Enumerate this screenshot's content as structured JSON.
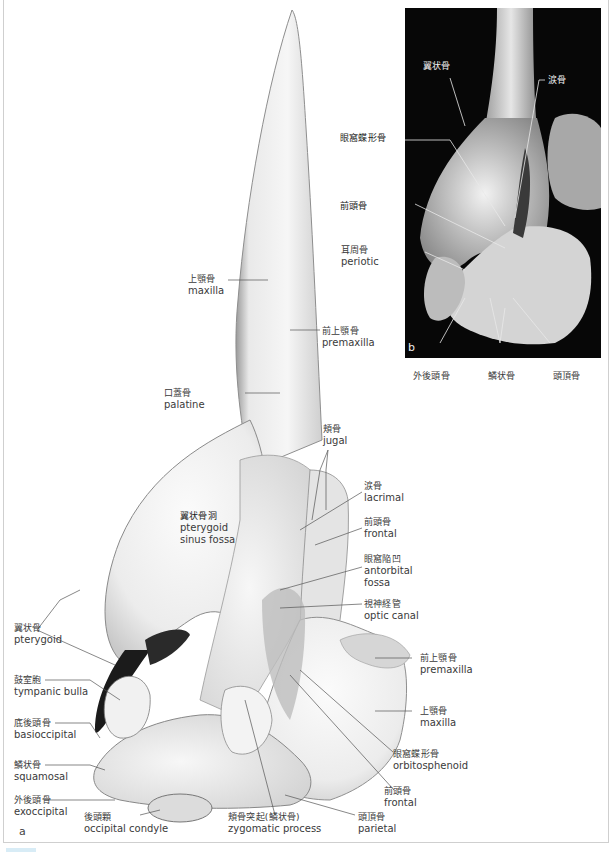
{
  "figure": {
    "panel_a": {
      "letter": "a",
      "labels": [
        {
          "id": "maxilla-upper",
          "jp": "上顎骨",
          "en": "maxilla"
        },
        {
          "id": "premaxilla-upper",
          "jp": "前上顎骨",
          "en": "premaxilla"
        },
        {
          "id": "palatine",
          "jp": "口蓋骨",
          "en": "palatine"
        },
        {
          "id": "jugal",
          "jp": "頬骨",
          "en": "jugal"
        },
        {
          "id": "lacrimal",
          "jp": "涙骨",
          "en": "lacrimal"
        },
        {
          "id": "frontal-upper",
          "jp": "前頭骨",
          "en": "frontal"
        },
        {
          "id": "pterygoid-sinus-fossa",
          "jp": "翼状骨洞",
          "en": "pterygoid",
          "en2": "sinus fossa"
        },
        {
          "id": "antorbital-fossa",
          "jp": "眼窩陥凹",
          "en": "antorbital",
          "en2": "fossa"
        },
        {
          "id": "optic-canal",
          "jp": "視神経管",
          "en": "optic canal"
        },
        {
          "id": "pterygoid",
          "jp": "翼状骨",
          "en": "pterygoid"
        },
        {
          "id": "premaxilla-lower",
          "jp": "前上顎骨",
          "en": "premaxilla"
        },
        {
          "id": "tympanic-bulla",
          "jp": "鼓室胞",
          "en": "tympanic bulla"
        },
        {
          "id": "maxilla-lower",
          "jp": "上顎骨",
          "en": "maxilla"
        },
        {
          "id": "basioccipital",
          "jp": "底後頭骨",
          "en": "basioccipital"
        },
        {
          "id": "orbitosphenoid",
          "jp": "眼窩蝶形骨",
          "en": "orbitosphenoid"
        },
        {
          "id": "squamosal",
          "jp": "鱗状骨",
          "en": "squamosal"
        },
        {
          "id": "frontal-lower",
          "jp": "前頭骨",
          "en": "frontal"
        },
        {
          "id": "exoccipital",
          "jp": "外後頭骨",
          "en": "exoccipital"
        },
        {
          "id": "occipital-condyle",
          "jp": "後頭顆",
          "en": "occipital condyle"
        },
        {
          "id": "zygomatic-process",
          "jp": "頬骨突起(鱗状骨)",
          "en": "zygomatic process"
        },
        {
          "id": "parietal",
          "jp": "頭頂骨",
          "en": "parietal"
        }
      ]
    },
    "panel_b": {
      "letter": "b",
      "labels": [
        {
          "id": "b-pterygoid",
          "jp": "翼状骨"
        },
        {
          "id": "b-lacrimal",
          "jp": "涙骨"
        },
        {
          "id": "b-orbitosphenoid",
          "jp": "眼窩蝶形骨"
        },
        {
          "id": "b-frontal",
          "jp": "前頭骨"
        },
        {
          "id": "b-periotic",
          "jp": "耳周骨",
          "en": "periotic"
        },
        {
          "id": "b-exoccipital",
          "jp": "外後頭骨"
        },
        {
          "id": "b-squamosal",
          "jp": "鱗状骨"
        },
        {
          "id": "b-parietal",
          "jp": "頭頂骨"
        }
      ]
    }
  }
}
